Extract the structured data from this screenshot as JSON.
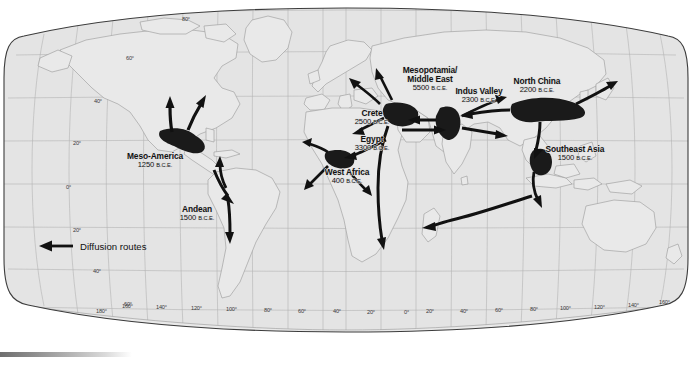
{
  "figure": {
    "map_fill": "#e4e4e4",
    "land_outline": "#9a9a9a",
    "graticule_color": "#b0b0b0",
    "globe_outline": "#3c3c3c",
    "arrow_color": "#111111"
  },
  "legend": {
    "label": "Diffusion routes",
    "icon": "left-arrow-icon"
  },
  "civilizations": [
    {
      "id": "meso-america",
      "name": "Meso-America",
      "date": "1250",
      "era": "B.C.E.",
      "label_x": 109,
      "label_y": 152,
      "label_w": 92
    },
    {
      "id": "andean",
      "name": "Andean",
      "date": "1500",
      "era": "B.C.E.",
      "label_x": 168,
      "label_y": 205,
      "label_w": 58
    },
    {
      "id": "west-africa",
      "name": "West Africa",
      "date": "400",
      "era": "B.C.E.",
      "label_x": 310,
      "label_y": 168,
      "label_w": 74
    },
    {
      "id": "egypt",
      "name": "Egypt",
      "date": "3300",
      "era": "B.C.E.",
      "label_x": 345,
      "label_y": 135,
      "label_w": 54
    },
    {
      "id": "crete",
      "name": "Crete",
      "date": "2500",
      "era": "B.C.E.",
      "label_x": 345,
      "label_y": 109,
      "label_w": 54
    },
    {
      "id": "mesopotamia",
      "name": "Mesopotamia/\nMiddle East",
      "date": "5500",
      "era": "B.C.E.",
      "label_x": 390,
      "label_y": 66,
      "label_w": 80
    },
    {
      "id": "indus-valley",
      "name": "Indus Valley",
      "date": "2300",
      "era": "B.C.E.",
      "label_x": 443,
      "label_y": 87,
      "label_w": 72
    },
    {
      "id": "north-china",
      "name": "North China",
      "date": "2200",
      "era": "B.C.E.",
      "label_x": 500,
      "label_y": 77,
      "label_w": 74
    },
    {
      "id": "southeast-asia",
      "name": "Southeast Asia",
      "date": "1500",
      "era": "B.C.E.",
      "label_x": 531,
      "label_y": 145,
      "label_w": 88
    }
  ],
  "graticule": {
    "latitude_left": [
      {
        "text": "80°",
        "x": 182,
        "y": 16
      },
      {
        "text": "60°",
        "x": 126,
        "y": 55
      },
      {
        "text": "40°",
        "x": 94,
        "y": 98
      },
      {
        "text": "20°",
        "x": 73,
        "y": 140
      },
      {
        "text": "0°",
        "x": 66,
        "y": 184
      },
      {
        "text": "20°",
        "x": 73,
        "y": 227
      },
      {
        "text": "40°",
        "x": 93,
        "y": 268
      },
      {
        "text": "60°",
        "x": 124,
        "y": 304
      }
    ],
    "longitude_bottom": [
      {
        "text": "180°",
        "x": 96
      },
      {
        "text": "160°",
        "x": 122
      },
      {
        "text": "140°",
        "x": 156
      },
      {
        "text": "120°",
        "x": 191
      },
      {
        "text": "100°",
        "x": 226
      },
      {
        "text": "80°",
        "x": 262
      },
      {
        "text": "60°",
        "x": 296
      },
      {
        "text": "40°",
        "x": 331
      },
      {
        "text": "20°",
        "x": 365
      },
      {
        "text": "0°",
        "x": 400
      },
      {
        "text": "20°",
        "x": 424
      },
      {
        "text": "40°",
        "x": 458
      },
      {
        "text": "60°",
        "x": 493
      },
      {
        "text": "80°",
        "x": 528
      },
      {
        "text": "100°",
        "x": 560
      },
      {
        "text": "120°",
        "x": 594
      },
      {
        "text": "140°",
        "x": 628
      },
      {
        "text": "160°",
        "x": 661
      },
      {
        "text": "180°",
        "x": 693
      }
    ],
    "longitude_y": 311
  }
}
